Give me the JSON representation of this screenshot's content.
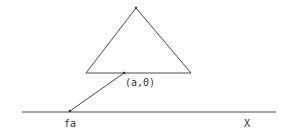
{
  "diagram": {
    "type": "geometric-mapping",
    "colors": {
      "stroke": "#4a4a4a",
      "text": "#333333",
      "background": "#ffffff"
    },
    "triangle": {
      "apex": [
        136,
        8
      ],
      "base_left": [
        86,
        73
      ],
      "base_right": [
        191,
        73
      ]
    },
    "point_a0": {
      "pos": [
        124,
        73
      ],
      "label": "(a,0)"
    },
    "axis": {
      "y": 112,
      "x_start": 22,
      "x_end": 276,
      "label": "X"
    },
    "point_fa": {
      "pos": [
        70,
        111
      ],
      "label": "fa"
    }
  }
}
